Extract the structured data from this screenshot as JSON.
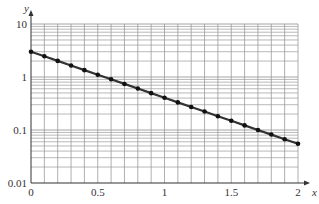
{
  "chart_data": {
    "type": "line",
    "title": "",
    "xlabel": "x",
    "ylabel": "y",
    "yscale": "log",
    "xlim": [
      0,
      2
    ],
    "ylim": [
      0.01,
      10
    ],
    "grid": true,
    "x_ticks": [
      {
        "value": 0,
        "label": "0"
      },
      {
        "value": 0.5,
        "label": "0.5"
      },
      {
        "value": 1,
        "label": "1"
      },
      {
        "value": 1.5,
        "label": "1.5"
      },
      {
        "value": 2,
        "label": "2"
      }
    ],
    "y_ticks": [
      {
        "value": 0.01,
        "label": "0.01"
      },
      {
        "value": 0.1,
        "label": "0.1"
      },
      {
        "value": 1,
        "label": "1"
      },
      {
        "value": 10,
        "label": "10"
      }
    ],
    "x_grid_step": 0.1,
    "series": [
      {
        "name": "y = 3e^(-2x)",
        "x": [
          0,
          0.1,
          0.2,
          0.3,
          0.4,
          0.5,
          0.6,
          0.7,
          0.8,
          0.9,
          1.0,
          1.1,
          1.2,
          1.3,
          1.4,
          1.5,
          1.6,
          1.7,
          1.8,
          1.9,
          2.0
        ],
        "values": [
          3.0,
          2.456,
          2.011,
          1.646,
          1.348,
          1.104,
          0.904,
          0.74,
          0.606,
          0.496,
          0.406,
          0.332,
          0.272,
          0.223,
          0.182,
          0.149,
          0.122,
          0.1,
          0.082,
          0.067,
          0.055
        ],
        "color": "#333333",
        "marker": "circle"
      }
    ]
  },
  "colors": {
    "grid": "#9a9a9a",
    "axis": "#333333",
    "line": "#333333"
  }
}
